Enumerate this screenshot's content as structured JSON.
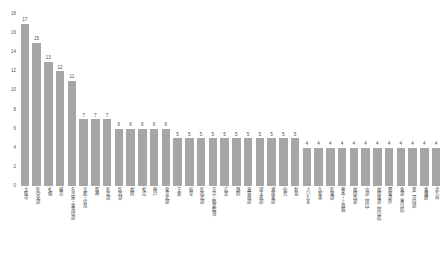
{
  "chart_data": {
    "type": "bar",
    "title": "",
    "subtitle": "",
    "xlabel": "",
    "ylabel": "",
    "ylim": [
      0,
      18
    ],
    "ytick_step": 2,
    "yticks": [
      0,
      2,
      4,
      6,
      8,
      10,
      12,
      14,
      16,
      18
    ],
    "grid": false,
    "legend": false,
    "legend_position": "none",
    "bar_color": "#a6a6a6",
    "value_labels_shown": true,
    "categories": [
      "大阪市",
      "区中央部",
      "札幌",
      "横浜",
      "名古屋・東海中部",
      "京都・伏見",
      "阪神",
      "区北部",
      "区西部",
      "福岡",
      "松山",
      "神戸",
      "東京北部",
      "千葉",
      "岐阜",
      "区西北部",
      "京浜・鶴見臨海",
      "広島",
      "静岡",
      "滋賀南部",
      "埼玉南部",
      "湘南東部",
      "仙台",
      "新潟",
      "さいたま",
      "久留米",
      "区東部",
      "熊本・上益城",
      "福岡西部",
      "中部（岡山）",
      "福岡東部（岡山県）",
      "関東郊外",
      "東部（香川県）",
      "第二河内部",
      "東播磨",
      "北九州"
    ],
    "values": [
      17,
      15,
      13,
      12,
      11,
      7,
      7,
      7,
      6,
      6,
      6,
      6,
      6,
      5,
      5,
      5,
      5,
      5,
      5,
      5,
      5,
      5,
      5,
      5,
      4,
      4,
      4,
      4,
      4,
      4,
      4,
      4,
      4,
      4,
      4,
      4
    ]
  }
}
